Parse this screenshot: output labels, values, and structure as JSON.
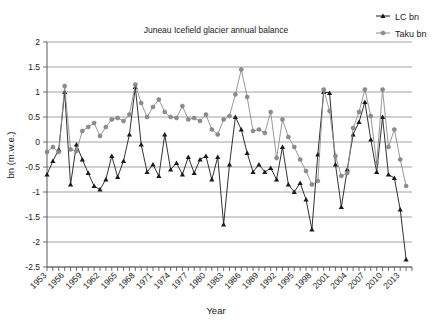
{
  "chart_data": {
    "type": "line",
    "title": "Juneau Icefield glacier annual balance",
    "xlabel": "Year",
    "ylabel": "bn (m.w.e.)",
    "xlim": [
      1953,
      2015
    ],
    "ylim": [
      -2.5,
      2
    ],
    "ytick_step": 0.5,
    "xtick_step": 1,
    "xtick_label_step": 3,
    "grid": true,
    "legend_position": "top-right",
    "x": [
      1953,
      1954,
      1955,
      1956,
      1957,
      1958,
      1959,
      1960,
      1961,
      1962,
      1963,
      1964,
      1965,
      1966,
      1967,
      1968,
      1969,
      1970,
      1971,
      1972,
      1973,
      1974,
      1975,
      1976,
      1977,
      1978,
      1979,
      1980,
      1981,
      1982,
      1983,
      1984,
      1985,
      1986,
      1987,
      1988,
      1989,
      1990,
      1991,
      1992,
      1993,
      1994,
      1995,
      1996,
      1997,
      1998,
      1999,
      2000,
      2001,
      2002,
      2003,
      2004,
      2005,
      2006,
      2007,
      2008,
      2009,
      2010,
      2011,
      2012,
      2013,
      2014
    ],
    "xtick_labels": [
      "1953",
      "1956",
      "1959",
      "1962",
      "1965",
      "1968",
      "1971",
      "1974",
      "1977",
      "1980",
      "1983",
      "1986",
      "1989",
      "1992",
      "1995",
      "1998",
      "2001",
      "2004",
      "2007",
      "2010",
      "2013"
    ],
    "ytick_labels": [
      "2",
      "1.5",
      "1",
      "0.5",
      "0",
      "-0.5",
      "-1",
      "-1.5",
      "-2",
      "-2.5"
    ],
    "series": [
      {
        "name": "LC bn",
        "color": "#1a1a1a",
        "marker": "triangle",
        "values": [
          -0.65,
          -0.38,
          -0.15,
          1.0,
          -0.85,
          -0.05,
          -0.35,
          -0.62,
          -0.88,
          -0.95,
          -0.75,
          -0.28,
          -0.7,
          -0.38,
          0.15,
          1.1,
          -0.05,
          -0.6,
          -0.45,
          -0.68,
          0.15,
          -0.55,
          -0.42,
          -0.65,
          -0.3,
          -0.62,
          -0.35,
          -0.28,
          -0.75,
          -0.3,
          -1.65,
          -0.45,
          0.5,
          0.25,
          -0.22,
          -0.6,
          -0.45,
          -0.6,
          -0.52,
          -0.75,
          -0.1,
          -0.85,
          -1.0,
          -0.82,
          -1.15,
          -1.75,
          -0.25,
          1.0,
          0.98,
          -0.45,
          -1.3,
          -0.55,
          0.15,
          0.4,
          0.8,
          0.05,
          -0.6,
          0.5,
          -0.65,
          -0.72,
          -1.35,
          -2.35
        ]
      },
      {
        "name": "Taku bn",
        "color": "#8c8c8c",
        "marker": "circle",
        "values": [
          -0.2,
          -0.1,
          -0.2,
          1.12,
          -0.15,
          -0.18,
          0.22,
          0.3,
          0.38,
          0.12,
          0.3,
          0.45,
          0.48,
          0.42,
          0.55,
          1.15,
          0.78,
          0.5,
          0.7,
          0.85,
          0.6,
          0.5,
          0.48,
          0.72,
          0.45,
          0.48,
          0.42,
          0.55,
          0.25,
          0.15,
          0.45,
          0.52,
          0.95,
          1.45,
          0.9,
          0.22,
          0.25,
          0.18,
          0.6,
          -0.32,
          0.45,
          0.1,
          -0.1,
          -0.35,
          -0.58,
          -0.85,
          -0.78,
          1.05,
          0.62,
          -0.28,
          -0.68,
          -0.62,
          0.28,
          0.6,
          1.05,
          0.52,
          -0.42,
          1.05,
          -0.1,
          0.25,
          -0.35,
          -0.88
        ]
      }
    ]
  },
  "legend": {
    "items": [
      {
        "label": "LC bn"
      },
      {
        "label": "Taku bn"
      }
    ]
  }
}
